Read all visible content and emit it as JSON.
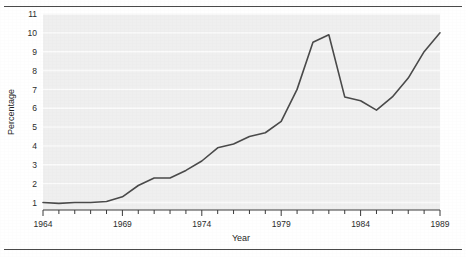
{
  "title": "1964-1989",
  "chart_data": {
    "type": "line",
    "title": "1964-1989",
    "xlabel": "Year",
    "ylabel": "Percentage",
    "xlim": [
      1964,
      1989
    ],
    "ylim": [
      0.6,
      11
    ],
    "grid": true,
    "legend": "none",
    "xticks_major": [
      1964,
      1969,
      1974,
      1979,
      1984,
      1989
    ],
    "xtick_labels": [
      "1964",
      "1969",
      "1974",
      "1979",
      "1984",
      "1989"
    ],
    "xticks_minor_step": 1,
    "yticks": [
      1,
      2,
      3,
      4,
      5,
      6,
      7,
      8,
      9,
      10,
      11
    ],
    "ytick_labels": [
      "1",
      "2",
      "3",
      "4",
      "5",
      "6",
      "7",
      "8",
      "9",
      "10",
      "11"
    ],
    "x": [
      1964,
      1965,
      1966,
      1967,
      1968,
      1969,
      1970,
      1971,
      1972,
      1973,
      1974,
      1975,
      1976,
      1977,
      1978,
      1979,
      1980,
      1981,
      1982,
      1983,
      1984,
      1985,
      1986,
      1987,
      1988,
      1989
    ],
    "values": [
      1.0,
      0.95,
      1.0,
      1.0,
      1.05,
      1.3,
      1.9,
      2.3,
      2.3,
      2.7,
      3.2,
      3.9,
      4.1,
      4.5,
      4.7,
      5.3,
      7.0,
      9.5,
      9.9,
      6.6,
      6.4,
      5.9,
      6.6,
      7.6,
      9.0,
      10.0
    ],
    "line_color": "#4a4a4a",
    "plot_bg": "#efefef",
    "gridline_color": "#fbfbfb"
  }
}
